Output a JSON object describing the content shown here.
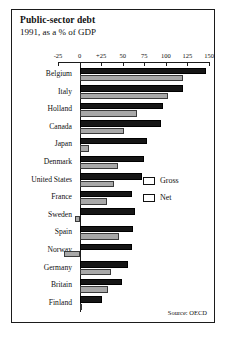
{
  "card": {
    "title": "Public-sector debt",
    "subtitle": "1991, as a % of GDP",
    "source": "Source: OECD"
  },
  "legend": {
    "entries": [
      {
        "label": "Gross",
        "color": "#161616",
        "name": "gross"
      },
      {
        "label": "Net",
        "color": "#a8a8a8",
        "name": "net"
      }
    ]
  },
  "chart_data": {
    "type": "bar",
    "orientation": "horizontal",
    "title": "Public-sector debt",
    "subtitle": "1991, as a % of GDP",
    "xlabel": "% of GDP",
    "ylabel": "",
    "xlim": [
      -25,
      150
    ],
    "xticks": [
      -25,
      0,
      25,
      50,
      75,
      100,
      125,
      150
    ],
    "xticklabels": [
      "-25",
      "0",
      "+25",
      "50",
      "75",
      "100",
      "125",
      "150"
    ],
    "grid": false,
    "legend_position": "right-middle",
    "source": "Source: OECD",
    "categories": [
      "Belgium",
      "Italy",
      "Holland",
      "Canada",
      "Japan",
      "Denmark",
      "United States",
      "France",
      "Sweden",
      "Spain",
      "Norway",
      "Germany",
      "Britain",
      "Finland"
    ],
    "series": [
      {
        "name": "Gross",
        "color": "#161616",
        "values": [
          146,
          120,
          97,
          94,
          78,
          75,
          72,
          61,
          64,
          62,
          61,
          56,
          49,
          26
        ]
      },
      {
        "name": "Net",
        "color": "#a8a8a8",
        "values": [
          120,
          102,
          67,
          52,
          11,
          45,
          40,
          32,
          -5,
          46,
          -18,
          37,
          33,
          3
        ]
      }
    ]
  }
}
